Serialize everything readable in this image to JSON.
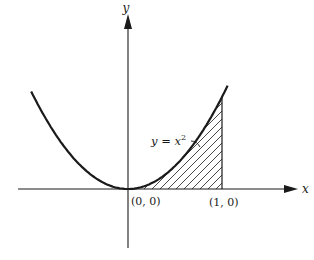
{
  "figure": {
    "axis_labels": {
      "x": "x",
      "y": "y"
    },
    "curve_label": "y = x",
    "curve_label_exponent": "2",
    "points": [
      {
        "label": "(0, 0)",
        "x": 0,
        "y": 0
      },
      {
        "label": "(1, 0)",
        "x": 1,
        "y": 0
      }
    ],
    "curve": {
      "function": "y = x^2",
      "x_range": [
        -1.03,
        1.06
      ]
    },
    "shaded_region": {
      "description": "area under y = x^2 from x = 0 to x = 1",
      "x_from": 0,
      "x_to": 1,
      "fill": "diagonal hatching"
    },
    "colors": {
      "ink": "#1a1a1a",
      "background": "#ffffff"
    }
  }
}
